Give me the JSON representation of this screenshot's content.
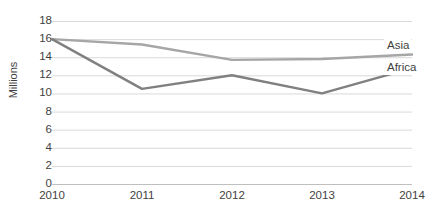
{
  "chart_data": {
    "type": "line",
    "title": "",
    "xlabel": "",
    "ylabel": "Millions",
    "categories": [
      "2010",
      "2011",
      "2012",
      "2013",
      "2014"
    ],
    "ylim": [
      0,
      18
    ],
    "ytick_step": 2,
    "yticks": [
      "18",
      "16",
      "14",
      "12",
      "10",
      "8",
      "6",
      "4",
      "2",
      "0"
    ],
    "grid": true,
    "grid_axis": "y",
    "legend_position": "right-inline",
    "series": [
      {
        "name": "Asia",
        "color": "#a6a6a6",
        "values": [
          16,
          15.4,
          13.7,
          13.8,
          14.3
        ]
      },
      {
        "name": "Africa",
        "color": "#808080",
        "values": [
          16,
          10.5,
          12,
          10,
          12.8
        ]
      }
    ]
  },
  "colors": {
    "gridline": "#d9d9d9",
    "axis": "#bfbfbf",
    "text": "#3f3f3f",
    "background": "#ffffff"
  }
}
